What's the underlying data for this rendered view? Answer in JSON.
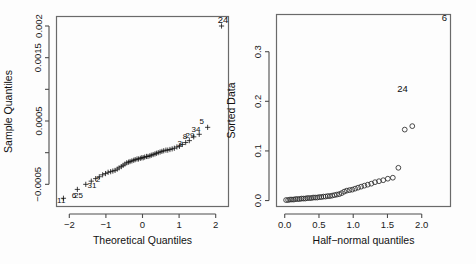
{
  "figure": {
    "width": 476,
    "height": 264,
    "background": "#fdfdfd",
    "panels": 2
  },
  "chart_data": [
    {
      "id": "qq-plot",
      "type": "scatter",
      "title": "",
      "xlabel": "Theoretical Quantiles",
      "ylabel": "Sample Quantiles",
      "xlim": [
        -2.35,
        2.35
      ],
      "ylim": [
        -0.00085,
        0.00215
      ],
      "xticks": [
        -2,
        -1,
        0,
        1,
        2
      ],
      "xticklabels": [
        "-2",
        "-1",
        "0",
        "1",
        "2"
      ],
      "yticks": [
        -0.0005,
        0.0,
        0.0005,
        0.001,
        0.0015,
        0.002
      ],
      "yticklabels": [
        "-0.0005",
        "",
        "0.0005",
        "",
        "0.0015",
        "0.002"
      ],
      "grid": false,
      "legend": null,
      "marker": "plus",
      "corner_annotation": {
        "text": "24",
        "x": 2.2,
        "y": 0.00205
      },
      "annotations": [
        {
          "text": "11",
          "x": -2.22,
          "y": -0.00079
        },
        {
          "text": "6",
          "x": -1.87,
          "y": -0.00072
        },
        {
          "text": "25",
          "x": -1.75,
          "y": -0.00072
        },
        {
          "text": "31",
          "x": -1.38,
          "y": -0.00055
        },
        {
          "text": "2",
          "x": -1.22,
          "y": -0.00046
        },
        {
          "text": "3",
          "x": 1.02,
          "y": 0.00011
        },
        {
          "text": "8",
          "x": 1.16,
          "y": 0.00022
        },
        {
          "text": "29",
          "x": 1.3,
          "y": 0.00023
        },
        {
          "text": "34",
          "x": 1.46,
          "y": 0.00032
        },
        {
          "text": "5",
          "x": 1.62,
          "y": 0.00046
        }
      ],
      "points": [
        {
          "x": -2.16,
          "y": -0.00072
        },
        {
          "x": -1.78,
          "y": -0.00058
        },
        {
          "x": -1.55,
          "y": -0.0005
        },
        {
          "x": -1.4,
          "y": -0.00045
        },
        {
          "x": -1.28,
          "y": -0.00041
        },
        {
          "x": -1.18,
          "y": -0.00038
        },
        {
          "x": -1.09,
          "y": -0.00035
        },
        {
          "x": -1.01,
          "y": -0.00033
        },
        {
          "x": -0.94,
          "y": -0.00031
        },
        {
          "x": -0.87,
          "y": -0.0003
        },
        {
          "x": -0.81,
          "y": -0.00029
        },
        {
          "x": -0.75,
          "y": -0.00028
        },
        {
          "x": -0.69,
          "y": -0.00026
        },
        {
          "x": -0.64,
          "y": -0.00024
        },
        {
          "x": -0.58,
          "y": -0.00022
        },
        {
          "x": -0.53,
          "y": -0.0002
        },
        {
          "x": -0.48,
          "y": -0.00018
        },
        {
          "x": -0.43,
          "y": -0.00016
        },
        {
          "x": -0.38,
          "y": -0.00015
        },
        {
          "x": -0.34,
          "y": -0.00014
        },
        {
          "x": -0.29,
          "y": -0.00013
        },
        {
          "x": -0.24,
          "y": -0.00012
        },
        {
          "x": -0.2,
          "y": -0.00011
        },
        {
          "x": -0.15,
          "y": -0.0001
        },
        {
          "x": -0.11,
          "y": -0.0001
        },
        {
          "x": -0.06,
          "y": -9e-05
        },
        {
          "x": -0.02,
          "y": -8e-05
        },
        {
          "x": 0.02,
          "y": -8e-05
        },
        {
          "x": 0.06,
          "y": -7e-05
        },
        {
          "x": 0.11,
          "y": -6e-05
        },
        {
          "x": 0.15,
          "y": -6e-05
        },
        {
          "x": 0.2,
          "y": -5e-05
        },
        {
          "x": 0.24,
          "y": -4e-05
        },
        {
          "x": 0.29,
          "y": -3e-05
        },
        {
          "x": 0.34,
          "y": -2e-05
        },
        {
          "x": 0.38,
          "y": -1e-05
        },
        {
          "x": 0.43,
          "y": 0.0
        },
        {
          "x": 0.48,
          "y": 1e-05
        },
        {
          "x": 0.53,
          "y": 2e-05
        },
        {
          "x": 0.58,
          "y": 3e-05
        },
        {
          "x": 0.64,
          "y": 4e-05
        },
        {
          "x": 0.69,
          "y": 4e-05
        },
        {
          "x": 0.75,
          "y": 5e-05
        },
        {
          "x": 0.81,
          "y": 6e-05
        },
        {
          "x": 0.87,
          "y": 7e-05
        },
        {
          "x": 0.94,
          "y": 9e-05
        },
        {
          "x": 1.01,
          "y": 0.0001
        },
        {
          "x": 1.09,
          "y": 0.00013
        },
        {
          "x": 1.18,
          "y": 0.00016
        },
        {
          "x": 1.28,
          "y": 0.00019
        },
        {
          "x": 1.4,
          "y": 0.00025
        },
        {
          "x": 1.55,
          "y": 0.00029
        },
        {
          "x": 1.78,
          "y": 0.0004
        },
        {
          "x": 2.16,
          "y": 0.002
        }
      ]
    },
    {
      "id": "half-normal-plot",
      "type": "scatter",
      "title": "",
      "xlabel": "Half-normal quantiles",
      "ylabel": "Sorted Data",
      "xlim": [
        -0.12,
        2.42
      ],
      "ylim": [
        -0.012,
        0.375
      ],
      "xticks": [
        0.0,
        0.5,
        1.0,
        1.5,
        2.0
      ],
      "xticklabels": [
        "0.0",
        "0.5",
        "1.0",
        "1.5",
        "2.0"
      ],
      "yticks": [
        0.0,
        0.1,
        0.2,
        0.3
      ],
      "yticklabels": [
        "0.0",
        "0.1",
        "0.2",
        "0.3"
      ],
      "grid": false,
      "legend": null,
      "marker": "circle",
      "corner_annotation": {
        "text": "6",
        "x": 2.33,
        "y": 0.362
      },
      "annotations": [
        {
          "text": "24",
          "x": 1.72,
          "y": 0.218
        }
      ],
      "points": [
        {
          "x": 0.02,
          "y": 0.001
        },
        {
          "x": 0.05,
          "y": 0.001
        },
        {
          "x": 0.078,
          "y": 0.002
        },
        {
          "x": 0.105,
          "y": 0.002
        },
        {
          "x": 0.133,
          "y": 0.002
        },
        {
          "x": 0.16,
          "y": 0.003
        },
        {
          "x": 0.188,
          "y": 0.003
        },
        {
          "x": 0.216,
          "y": 0.003
        },
        {
          "x": 0.244,
          "y": 0.004
        },
        {
          "x": 0.272,
          "y": 0.004
        },
        {
          "x": 0.3,
          "y": 0.004
        },
        {
          "x": 0.328,
          "y": 0.005
        },
        {
          "x": 0.357,
          "y": 0.005
        },
        {
          "x": 0.386,
          "y": 0.005
        },
        {
          "x": 0.415,
          "y": 0.006
        },
        {
          "x": 0.444,
          "y": 0.006
        },
        {
          "x": 0.474,
          "y": 0.006
        },
        {
          "x": 0.504,
          "y": 0.007
        },
        {
          "x": 0.534,
          "y": 0.007
        },
        {
          "x": 0.565,
          "y": 0.008
        },
        {
          "x": 0.596,
          "y": 0.008
        },
        {
          "x": 0.628,
          "y": 0.009
        },
        {
          "x": 0.66,
          "y": 0.009
        },
        {
          "x": 0.693,
          "y": 0.01
        },
        {
          "x": 0.727,
          "y": 0.011
        },
        {
          "x": 0.761,
          "y": 0.012
        },
        {
          "x": 0.796,
          "y": 0.013
        },
        {
          "x": 0.832,
          "y": 0.015
        },
        {
          "x": 0.869,
          "y": 0.018
        },
        {
          "x": 0.907,
          "y": 0.02
        },
        {
          "x": 0.946,
          "y": 0.021
        },
        {
          "x": 0.986,
          "y": 0.022
        },
        {
          "x": 1.028,
          "y": 0.024
        },
        {
          "x": 1.071,
          "y": 0.026
        },
        {
          "x": 1.116,
          "y": 0.028
        },
        {
          "x": 1.163,
          "y": 0.03
        },
        {
          "x": 1.212,
          "y": 0.032
        },
        {
          "x": 1.264,
          "y": 0.034
        },
        {
          "x": 1.318,
          "y": 0.037
        },
        {
          "x": 1.376,
          "y": 0.039
        },
        {
          "x": 1.438,
          "y": 0.041
        },
        {
          "x": 1.505,
          "y": 0.044
        },
        {
          "x": 1.578,
          "y": 0.046
        },
        {
          "x": 1.659,
          "y": 0.066
        },
        {
          "x": 1.752,
          "y": 0.143
        },
        {
          "x": 1.862,
          "y": 0.15
        }
      ]
    }
  ]
}
